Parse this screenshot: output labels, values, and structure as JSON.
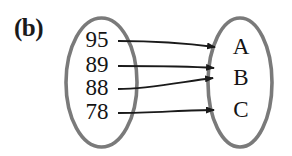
{
  "figure": {
    "label": "(b)",
    "type": "mapping-diagram",
    "colors": {
      "ellipse_stroke": "#7a7a7a",
      "arrow_stroke": "#1a1a1a",
      "text": "#141414",
      "background": "#ffffff"
    }
  },
  "domain_set": {
    "name": "domain-ellipse",
    "cx": 101.5,
    "cy": 82.5,
    "rx": 35.5,
    "ry": 64.5,
    "items": [
      {
        "label": "95",
        "x": 97,
        "y": 40
      },
      {
        "label": "89",
        "x": 97,
        "y": 65
      },
      {
        "label": "88",
        "x": 97,
        "y": 88
      },
      {
        "label": "78",
        "x": 97,
        "y": 112
      }
    ]
  },
  "range_set": {
    "name": "range-ellipse",
    "cx": 240,
    "cy": 82.5,
    "rx": 32,
    "ry": 64.5,
    "items": [
      {
        "label": "A",
        "x": 241,
        "y": 47
      },
      {
        "label": "B",
        "x": 241,
        "y": 78
      },
      {
        "label": "C",
        "x": 241,
        "y": 110
      }
    ]
  },
  "mappings": [
    {
      "from": "95",
      "to": "A",
      "path": "M 118 41 C 150 41, 185 43, 215 47"
    },
    {
      "from": "89",
      "to": "B",
      "path": "M 118 66 C 150 66, 186 66, 214 68"
    },
    {
      "from": "88",
      "to": "B",
      "path": "M 118 89 C 150 89, 186 81, 213 78"
    },
    {
      "from": "78",
      "to": "C",
      "path": "M 118 113 C 150 113, 188 110, 214 110"
    }
  ],
  "arrowheads": [
    {
      "for": "A",
      "x": 216,
      "y": 47
    },
    {
      "for": "B1",
      "x": 215,
      "y": 68
    },
    {
      "for": "B2",
      "x": 214,
      "y": 78
    },
    {
      "for": "C",
      "x": 215,
      "y": 110
    }
  ]
}
